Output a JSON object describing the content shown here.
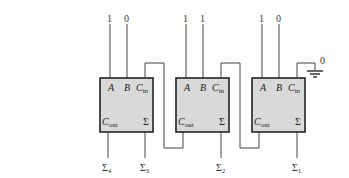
{
  "adders": [
    {
      "id": "adder-left",
      "inputs": {
        "A": "1",
        "B": "0"
      },
      "labels": {
        "a": "A",
        "b": "B",
        "cin": "C",
        "cin_sub": "in",
        "cout": "C",
        "cout_sub": "out",
        "sum": "Σ"
      },
      "output": {
        "sym": "Σ",
        "sub": "3"
      },
      "carry_out_label": {
        "sym": "Σ",
        "sub": "4"
      }
    },
    {
      "id": "adder-middle",
      "inputs": {
        "A": "1",
        "B": "1"
      },
      "labels": {
        "a": "A",
        "b": "B",
        "cin": "C",
        "cin_sub": "in",
        "cout": "C",
        "cout_sub": "out",
        "sum": "Σ"
      },
      "output": {
        "sym": "Σ",
        "sub": "2"
      }
    },
    {
      "id": "adder-right",
      "inputs": {
        "A": "1",
        "B": "0"
      },
      "labels": {
        "a": "A",
        "b": "B",
        "cin": "C",
        "cin_sub": "in",
        "cout": "C",
        "cout_sub": "out",
        "sum": "Σ"
      },
      "output": {
        "sym": "Σ",
        "sub": "1"
      }
    }
  ],
  "ground": {
    "value": "0"
  },
  "colors": {
    "box_fill": "#d9d9d9",
    "box_stroke": "#222222",
    "wire": "#444444"
  }
}
